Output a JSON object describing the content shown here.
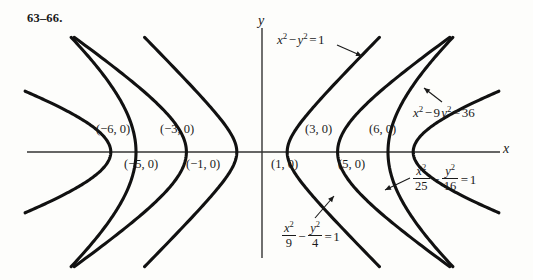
{
  "figure": {
    "problem_label": "63–66.",
    "axis_x_label": "x",
    "axis_y_label": "y",
    "background_color": "#fdfdfb",
    "curve_color": "#111111",
    "axis_color": "#333333"
  },
  "vertex_labels": [
    {
      "text": "(−6, 0)",
      "x": -6,
      "y": 0,
      "position": "above"
    },
    {
      "text": "(−3, 0)",
      "x": -3,
      "y": 0,
      "position": "above"
    },
    {
      "text": "(−5, 0)",
      "x": -5,
      "y": 0,
      "position": "below"
    },
    {
      "text": "(−1, 0)",
      "x": -1,
      "y": 0,
      "position": "below"
    },
    {
      "text": "(1, 0)",
      "x": 1,
      "y": 0,
      "position": "below"
    },
    {
      "text": "(3, 0)",
      "x": 3,
      "y": 0,
      "position": "above"
    },
    {
      "text": "(5, 0)",
      "x": 5,
      "y": 0,
      "position": "below"
    },
    {
      "text": "(6, 0)",
      "x": 6,
      "y": 0,
      "position": "above"
    }
  ],
  "equations": [
    {
      "id": "hyperbola-1",
      "plain": "x² − y² = 1",
      "a": 1,
      "b": 1,
      "vertices": [
        -1,
        1
      ],
      "label_position": "top-center"
    },
    {
      "id": "hyperbola-9-4",
      "plain": "x²/9 − y²/4 = 1",
      "numerator_1": "x",
      "denominator_1": "9",
      "numerator_2": "y",
      "denominator_2": "4",
      "rhs": "1",
      "a": 3,
      "b": 2,
      "vertices": [
        -3,
        3
      ],
      "label_position": "bottom-center"
    },
    {
      "id": "hyperbola-25-16",
      "plain": "x²/25 − y²/16 = 1",
      "numerator_1": "x",
      "denominator_1": "25",
      "numerator_2": "y",
      "denominator_2": "16",
      "rhs": "1",
      "a": 5,
      "b": 4,
      "vertices": [
        -5,
        5
      ],
      "label_position": "bottom-right"
    },
    {
      "id": "hyperbola-36",
      "plain": "x² − 9y² = 36",
      "coefficient": "9",
      "rhs": "36",
      "a": 6,
      "b": 2,
      "vertices": [
        -6,
        6
      ],
      "label_position": "top-right"
    }
  ],
  "chart_data": {
    "type": "line",
    "title": "",
    "xlabel": "x",
    "ylabel": "y",
    "xlim": [
      -9.4,
      9.4
    ],
    "ylim": [
      -4.6,
      4.6
    ],
    "grid": false,
    "legend": "annotations",
    "series": [
      {
        "name": "x^2 - y^2 = 1",
        "a": 1,
        "b": 1,
        "vertex_x": 1
      },
      {
        "name": "x^2/9 - y^2/4 = 1",
        "a": 3,
        "b": 2,
        "vertex_x": 3
      },
      {
        "name": "x^2/25 - y^2/16 = 1",
        "a": 5,
        "b": 4,
        "vertex_x": 5
      },
      {
        "name": "x^2 - 9y^2 = 36",
        "a": 6,
        "b": 2,
        "vertex_x": 6
      }
    ],
    "annotations": [
      "x^2 - y^2 = 1",
      "x^2 - 9y^2 = 36",
      "x^2/25 - y^2/16 = 1",
      "x^2/9 - y^2/4 = 1",
      "(-6, 0)",
      "(-5, 0)",
      "(-3, 0)",
      "(-1, 0)",
      "(1, 0)",
      "(3, 0)",
      "(5, 0)",
      "(6, 0)"
    ]
  }
}
